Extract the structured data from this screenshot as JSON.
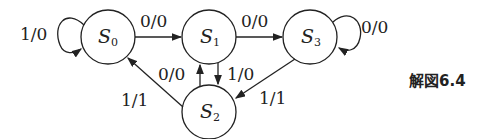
{
  "diagram": {
    "type": "state-transition-diagram",
    "caption": "解図6.4",
    "states": [
      {
        "id": "S0",
        "label": "S",
        "sub": "0"
      },
      {
        "id": "S1",
        "label": "S",
        "sub": "1"
      },
      {
        "id": "S2",
        "label": "S",
        "sub": "2"
      },
      {
        "id": "S3",
        "label": "S",
        "sub": "3"
      }
    ],
    "transitions": [
      {
        "from": "S0",
        "to": "S0",
        "label": "1/0"
      },
      {
        "from": "S0",
        "to": "S1",
        "label": "0/0"
      },
      {
        "from": "S1",
        "to": "S3",
        "label": "0/0"
      },
      {
        "from": "S3",
        "to": "S3",
        "label": "0/0"
      },
      {
        "from": "S1",
        "to": "S2",
        "label": "1/0"
      },
      {
        "from": "S2",
        "to": "S1",
        "label": "0/0"
      },
      {
        "from": "S3",
        "to": "S2",
        "label": "1/1"
      },
      {
        "from": "S2",
        "to": "S0",
        "label": "1/1"
      }
    ]
  }
}
